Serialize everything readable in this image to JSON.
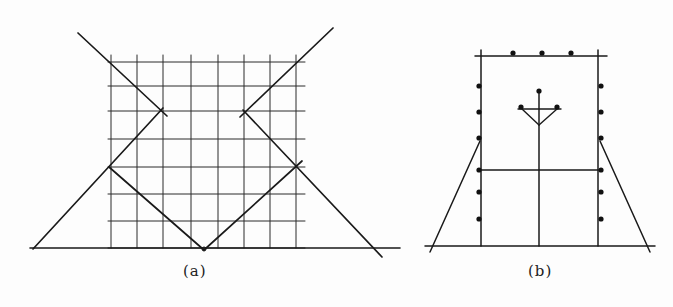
{
  "figure": {
    "panels": [
      {
        "id": "a",
        "caption": "(a)",
        "description": "Square grid (8 columns x 7 rows of cells) with a ground line and diagonal lines forming an X-shaped/zigzag pattern meeting at a V vertex on the ground line",
        "grid": {
          "x_lines": [
            111,
            137,
            163,
            191,
            218,
            244,
            270,
            296
          ],
          "y_lines": [
            62,
            86,
            111,
            139,
            167,
            194,
            221,
            248
          ],
          "x_extent": [
            108,
            305
          ],
          "y_extent": [
            55,
            248
          ]
        },
        "ground_line": {
          "x1": 30,
          "y1": 248,
          "x2": 400,
          "y2": 248
        },
        "segments": [
          {
            "name": "upper-left-diagonal",
            "x1": 78,
            "y1": 33,
            "x2": 167,
            "y2": 116
          },
          {
            "name": "left-rising-diagonal",
            "x1": 33,
            "y1": 249,
            "x2": 163,
            "y2": 108
          },
          {
            "name": "left-falling-to-vertex",
            "x1": 109,
            "y1": 167,
            "x2": 204,
            "y2": 250
          },
          {
            "name": "right-rising-from-vertex",
            "x1": 204,
            "y1": 250,
            "x2": 302,
            "y2": 161
          },
          {
            "name": "upper-right-diagonal",
            "x1": 333,
            "y1": 28,
            "x2": 240,
            "y2": 117
          },
          {
            "name": "right-falling-diagonal",
            "x1": 243,
            "y1": 110,
            "x2": 382,
            "y2": 257
          }
        ],
        "markers": [
          {
            "name": "vertex-marker",
            "x": 204,
            "y": 249
          }
        ]
      },
      {
        "id": "b",
        "caption": "(b)",
        "description": "Rectangular frame standing on a ground line with two sloped side struts, a center vertical post topped by a Y-shaped fork, a horizontal crossbar, and dot markers along the top and both sides",
        "frame": {
          "x_left": 481,
          "x_right": 598,
          "y_top": 56,
          "y_bottom": 246
        },
        "top_line": {
          "x1": 475,
          "x2": 607,
          "y": 56
        },
        "ground_line": {
          "x1": 425,
          "x2": 655,
          "y": 246
        },
        "crossbar": {
          "x1": 481,
          "x2": 598,
          "y": 170
        },
        "center_post": {
          "x": 539,
          "y_top": 91,
          "y_bottom": 246
        },
        "fork": {
          "bar": {
            "x1": 518,
            "x2": 561,
            "y": 109
          },
          "apex": {
            "x": 539,
            "y": 125
          },
          "arm_left_top": {
            "x": 522,
            "y": 109
          },
          "arm_right_top": {
            "x": 557,
            "y": 109
          },
          "dots": [
            {
              "x": 539,
              "y": 91
            },
            {
              "x": 521,
              "y": 107
            },
            {
              "x": 557,
              "y": 107
            }
          ]
        },
        "struts": [
          {
            "name": "left-strut",
            "x1": 480,
            "y1": 141,
            "x2": 430,
            "y2": 252
          },
          {
            "name": "right-strut",
            "x1": 600,
            "y1": 141,
            "x2": 650,
            "y2": 252
          }
        ],
        "dots": {
          "top": [
            {
              "x": 513,
              "y": 53
            },
            {
              "x": 542,
              "y": 53
            },
            {
              "x": 571,
              "y": 53
            }
          ],
          "left": [
            {
              "x": 479,
              "y": 86
            },
            {
              "x": 479,
              "y": 112
            },
            {
              "x": 479,
              "y": 138
            },
            {
              "x": 479,
              "y": 170
            },
            {
              "x": 479,
              "y": 192
            },
            {
              "x": 479,
              "y": 219
            }
          ],
          "right": [
            {
              "x": 601,
              "y": 86
            },
            {
              "x": 601,
              "y": 112
            },
            {
              "x": 601,
              "y": 138
            },
            {
              "x": 601,
              "y": 170
            },
            {
              "x": 601,
              "y": 192
            },
            {
              "x": 601,
              "y": 219
            }
          ]
        }
      }
    ],
    "colors": {
      "background": "#fdfdfd",
      "line": "#1a1a1a",
      "grid_line": "#2a2a2a",
      "dot": "#111111",
      "text": "#222222"
    }
  }
}
